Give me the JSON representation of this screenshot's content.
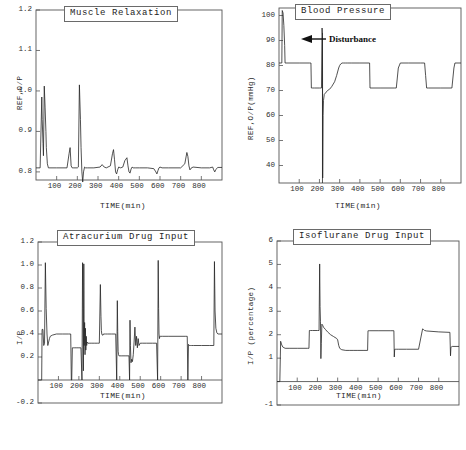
{
  "figure": {
    "background": "#ffffff",
    "line_color": "#262626",
    "axis_color": "#555555"
  },
  "panels": [
    {
      "id": "muscle-relaxation",
      "title": "Muscle Relaxation",
      "xlabel": "TIME(min)",
      "ylabel": "REF,O/P",
      "xticks": [
        "100",
        "200",
        "300",
        "400",
        "500",
        "600",
        "700",
        "800"
      ],
      "yticks": [
        "0.8",
        "0.9",
        "1.0",
        "1.1",
        "1.2"
      ]
    },
    {
      "id": "blood-pressure",
      "title": "Blood Pressure",
      "xlabel": "TIME(min)",
      "ylabel": "REF,O/P(mmHg)",
      "xticks": [
        "100",
        "200",
        "300",
        "400",
        "500",
        "600",
        "700",
        "800"
      ],
      "yticks": [
        "40",
        "50",
        "60",
        "70",
        "80",
        "90",
        "100"
      ],
      "annotation": "Disturbance"
    },
    {
      "id": "atracurium-drug-input",
      "title": "Atracurium Drug Input",
      "xlabel": "TIME(min)",
      "ylabel": "I/P",
      "xticks": [
        "100",
        "200",
        "300",
        "400",
        "500",
        "600",
        "700",
        "800"
      ],
      "yticks": [
        "-0.2",
        "0.2",
        "0.4",
        "0.6",
        "0.8",
        "1.0",
        "1.2"
      ]
    },
    {
      "id": "isoflurane-drug-input",
      "title": "Isoflurane Drug Input",
      "xlabel": "TIME(min)",
      "ylabel": "I/P (percentage)",
      "xticks": [
        "100",
        "200",
        "300",
        "400",
        "500",
        "600",
        "700",
        "800"
      ],
      "yticks": [
        "-1",
        "1",
        "2",
        "3",
        "4",
        "5",
        "6"
      ]
    }
  ],
  "chart_data": [
    {
      "type": "line",
      "title": "Muscle Relaxation",
      "xlabel": "TIME(min)",
      "ylabel": "REF,O/P",
      "xlim": [
        0,
        900
      ],
      "ylim": [
        0.78,
        1.2
      ],
      "grid": false,
      "legend": null,
      "series": [
        {
          "name": "reference and output",
          "baseline": 0.81,
          "x": [
            0,
            20,
            28,
            30,
            34,
            36,
            40,
            44,
            48,
            50,
            55,
            60,
            100,
            150,
            160,
            165,
            170,
            175,
            180,
            200,
            205,
            210,
            215,
            218,
            222,
            226,
            230,
            235,
            240,
            250,
            280,
            310,
            320,
            330,
            340,
            360,
            370,
            375,
            380,
            385,
            390,
            395,
            400,
            410,
            420,
            430,
            440,
            445,
            450,
            455,
            460,
            465,
            470,
            480,
            500,
            540,
            570,
            580,
            585,
            590,
            595,
            600,
            610,
            640,
            700,
            720,
            730,
            735,
            740,
            745,
            750,
            760,
            800,
            840,
            855,
            860,
            865,
            870,
            880,
            900
          ],
          "y": [
            0.81,
            0.81,
            0.985,
            0.93,
            0.87,
            0.84,
            1.012,
            0.96,
            0.9,
            0.86,
            0.82,
            0.81,
            0.81,
            0.81,
            0.845,
            0.86,
            0.815,
            0.81,
            0.81,
            0.81,
            0.812,
            1.015,
            0.93,
            0.86,
            0.8,
            0.775,
            0.8,
            0.812,
            0.81,
            0.81,
            0.81,
            0.812,
            0.818,
            0.812,
            0.81,
            0.815,
            0.845,
            0.855,
            0.83,
            0.8,
            0.795,
            0.805,
            0.812,
            0.81,
            0.812,
            0.828,
            0.835,
            0.815,
            0.8,
            0.797,
            0.807,
            0.812,
            0.81,
            0.81,
            0.81,
            0.81,
            0.808,
            0.8,
            0.795,
            0.803,
            0.81,
            0.812,
            0.81,
            0.81,
            0.81,
            0.82,
            0.848,
            0.838,
            0.815,
            0.805,
            0.809,
            0.812,
            0.81,
            0.81,
            0.812,
            0.805,
            0.8,
            0.806,
            0.811,
            0.811
          ]
        }
      ]
    },
    {
      "type": "line",
      "title": "Blood Pressure",
      "xlabel": "TIME(min)",
      "ylabel": "REF,O/P(mmHg)",
      "xlim": [
        0,
        900
      ],
      "ylim": [
        33,
        103
      ],
      "grid": false,
      "annotations": [
        {
          "text": "Disturbance",
          "x": 215,
          "y": 90
        }
      ],
      "series": [
        {
          "name": "reference and output",
          "x": [
            0,
            14,
            16,
            20,
            24,
            28,
            30,
            100,
            150,
            158,
            160,
            165,
            175,
            200,
            210,
            213,
            215,
            216,
            218,
            220,
            224,
            230,
            240,
            250,
            260,
            275,
            285,
            295,
            300,
            305,
            312,
            320,
            330,
            340,
            360,
            400,
            440,
            448,
            450,
            455,
            460,
            500,
            570,
            580,
            585,
            590,
            600,
            640,
            700,
            720,
            725,
            730,
            740,
            800,
            855,
            860,
            865,
            870,
            900
          ],
          "y": [
            81,
            81,
            102,
            101,
            96,
            88,
            81,
            81,
            81,
            81,
            71,
            71,
            71,
            71,
            71,
            95,
            92,
            35,
            60,
            66,
            68.5,
            69,
            70,
            70.5,
            71.5,
            73.5,
            76,
            79,
            80,
            80.6,
            81,
            81,
            81,
            81,
            81,
            81,
            81,
            81,
            71,
            71,
            71,
            71,
            71,
            71,
            75,
            79,
            81,
            81,
            81,
            81,
            76,
            71,
            71,
            71,
            71,
            75,
            79,
            81,
            81
          ]
        }
      ]
    },
    {
      "type": "line",
      "title": "Atracurium Drug Input",
      "xlabel": "TIME(min)",
      "ylabel": "I/P",
      "xlim": [
        0,
        900
      ],
      "ylim": [
        -0.2,
        1.2
      ],
      "grid": false,
      "series": [
        {
          "name": "drug infusion rate",
          "x": [
            0,
            18,
            20,
            24,
            28,
            32,
            36,
            40,
            44,
            48,
            52,
            56,
            60,
            70,
            90,
            120,
            150,
            160,
            163,
            165,
            168,
            172,
            176,
            180,
            190,
            200,
            210,
            215,
            218,
            220,
            222,
            224,
            226,
            228,
            230,
            232,
            234,
            236,
            238,
            240,
            244,
            250,
            260,
            275,
            290,
            300,
            305,
            308,
            310,
            312,
            315,
            318,
            320,
            330,
            340,
            360,
            380,
            385,
            388,
            390,
            392,
            394,
            396,
            400,
            410,
            430,
            445,
            448,
            450,
            452,
            455,
            458,
            462,
            466,
            470,
            474,
            478,
            482,
            486,
            490,
            494,
            500,
            510,
            530,
            560,
            580,
            585,
            588,
            590,
            592,
            594,
            596,
            600,
            610,
            640,
            680,
            720,
            730,
            733,
            736,
            740,
            745,
            750,
            760,
            800,
            840,
            860,
            863,
            866,
            870,
            875,
            880,
            890,
            900
          ],
          "y": [
            0.0,
            0.0,
            0.44,
            0.44,
            0.3,
            0.32,
            1.02,
            0.62,
            0.4,
            0.3,
            0.33,
            0.36,
            0.38,
            0.39,
            0.4,
            0.4,
            0.4,
            0.4,
            0.0,
            0.0,
            0.28,
            0.28,
            0.28,
            0.28,
            0.28,
            0.28,
            0.28,
            0.0,
            1.02,
            0.62,
            0.08,
            1.01,
            0.3,
            0.5,
            0.22,
            0.45,
            0.26,
            0.38,
            0.3,
            0.33,
            0.32,
            0.32,
            0.32,
            0.32,
            0.32,
            0.32,
            0.83,
            0.55,
            0.43,
            0.4,
            0.39,
            0.39,
            0.4,
            0.4,
            0.4,
            0.4,
            0.4,
            0.0,
            0.69,
            0.42,
            0.25,
            0.22,
            0.21,
            0.21,
            0.21,
            0.21,
            0.21,
            0.0,
            0.52,
            0.3,
            0.15,
            0.18,
            0.16,
            0.22,
            0.33,
            0.46,
            0.3,
            0.38,
            0.28,
            0.36,
            0.3,
            0.32,
            0.32,
            0.32,
            0.32,
            0.32,
            0.0,
            1.04,
            0.62,
            0.4,
            0.36,
            0.38,
            0.38,
            0.38,
            0.38,
            0.38,
            0.38,
            0.38,
            0.0,
            0.31,
            0.3,
            0.3,
            0.3,
            0.3,
            0.3,
            0.3,
            0.3,
            1.03,
            0.6,
            0.45,
            0.41,
            0.4,
            0.4,
            0.4
          ]
        }
      ]
    },
    {
      "type": "line",
      "title": "Isoflurane Drug Input",
      "xlabel": "TIME(min)",
      "ylabel": "I/P (percentage)",
      "xlim": [
        0,
        900
      ],
      "ylim": [
        -1,
        6
      ],
      "grid": false,
      "series": [
        {
          "name": "inspired concentration",
          "x": [
            0,
            14,
            18,
            22,
            28,
            40,
            60,
            100,
            150,
            158,
            160,
            165,
            175,
            200,
            208,
            211,
            213,
            215,
            217,
            219,
            222,
            226,
            230,
            240,
            250,
            265,
            280,
            295,
            300,
            305,
            310,
            320,
            340,
            360,
            380,
            400,
            430,
            448,
            450,
            452,
            456,
            460,
            500,
            560,
            578,
            580,
            582,
            585,
            590,
            600,
            640,
            700,
            720,
            725,
            728,
            730,
            740,
            800,
            855,
            858,
            860,
            862,
            866,
            870,
            900
          ],
          "y": [
            0.0,
            0.0,
            1.72,
            1.6,
            1.48,
            1.42,
            1.42,
            1.42,
            1.42,
            1.42,
            2.18,
            2.18,
            2.18,
            2.18,
            2.18,
            5.02,
            3.2,
            2.55,
            0.98,
            1.62,
            2.45,
            2.4,
            2.32,
            2.22,
            2.12,
            2.0,
            1.92,
            1.84,
            1.78,
            1.55,
            1.42,
            1.36,
            1.33,
            1.33,
            1.33,
            1.33,
            1.33,
            1.33,
            2.17,
            2.17,
            2.17,
            2.17,
            2.17,
            2.17,
            2.17,
            1.05,
            1.38,
            1.38,
            1.38,
            1.38,
            1.38,
            1.38,
            2.25,
            2.22,
            2.2,
            2.18,
            2.16,
            2.12,
            2.1,
            1.1,
            1.45,
            1.48,
            1.5,
            1.5,
            1.5
          ]
        }
      ]
    }
  ]
}
